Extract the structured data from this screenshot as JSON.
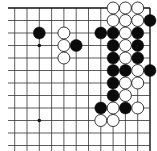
{
  "board": {
    "description": "Go board corner diagram (top-right corner)",
    "grid": {
      "cols": 12,
      "rows": 12,
      "origin_x": 14.7,
      "origin_y": 8,
      "spacing_x": 12.3,
      "spacing_y": 12.5,
      "edges": {
        "top": true,
        "right": true,
        "left": false,
        "bottom": false
      },
      "line_color": "#333333",
      "edge_color": "#111111"
    },
    "stone_radius": 6,
    "colors": {
      "black": "#0a0a0a",
      "white": "#ffffff",
      "white_stroke": "#222222",
      "background": "#ffffff"
    },
    "hoshi": [
      {
        "c": 2,
        "r": 3
      },
      {
        "c": 2,
        "r": 9
      }
    ],
    "stones": [
      {
        "color": "white",
        "c": 8,
        "r": 0
      },
      {
        "color": "white",
        "c": 9,
        "r": 0
      },
      {
        "color": "white",
        "c": 10,
        "r": 0
      },
      {
        "color": "white",
        "c": 8,
        "r": 1
      },
      {
        "color": "white",
        "c": 9,
        "r": 1
      },
      {
        "color": "white",
        "c": 10,
        "r": 1
      },
      {
        "color": "black",
        "c": 11,
        "r": 1
      },
      {
        "color": "black",
        "c": 2,
        "r": 2
      },
      {
        "color": "white",
        "c": 4,
        "r": 2
      },
      {
        "color": "black",
        "c": 7,
        "r": 2
      },
      {
        "color": "black",
        "c": 8,
        "r": 2
      },
      {
        "color": "white",
        "c": 9,
        "r": 2
      },
      {
        "color": "black",
        "c": 10,
        "r": 2
      },
      {
        "color": "white",
        "c": 4,
        "r": 3
      },
      {
        "color": "black",
        "c": 5,
        "r": 3
      },
      {
        "color": "black",
        "c": 8,
        "r": 3
      },
      {
        "color": "white",
        "c": 9,
        "r": 3
      },
      {
        "color": "black",
        "c": 10,
        "r": 3
      },
      {
        "color": "white",
        "c": 4,
        "r": 4
      },
      {
        "color": "black",
        "c": 8,
        "r": 4
      },
      {
        "color": "white",
        "c": 9,
        "r": 4
      },
      {
        "color": "black",
        "c": 10,
        "r": 4
      },
      {
        "color": "black",
        "c": 8,
        "r": 5
      },
      {
        "color": "black",
        "c": 9,
        "r": 5
      },
      {
        "color": "white",
        "c": 10,
        "r": 5
      },
      {
        "color": "black",
        "c": 11,
        "r": 5
      },
      {
        "color": "black",
        "c": 8,
        "r": 6
      },
      {
        "color": "white",
        "c": 9,
        "r": 6
      },
      {
        "color": "white",
        "c": 10,
        "r": 6
      },
      {
        "color": "black",
        "c": 8,
        "r": 7
      },
      {
        "color": "white",
        "c": 9,
        "r": 7
      },
      {
        "color": "black",
        "c": 7,
        "r": 8
      },
      {
        "color": "white",
        "c": 8,
        "r": 8
      },
      {
        "color": "black",
        "c": 9,
        "r": 8
      },
      {
        "color": "white",
        "c": 10,
        "r": 8
      },
      {
        "color": "white",
        "c": 7,
        "r": 9
      },
      {
        "color": "white",
        "c": 8,
        "r": 9
      }
    ]
  }
}
